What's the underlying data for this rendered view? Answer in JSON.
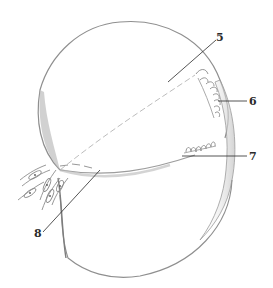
{
  "figure": {
    "type": "anatomical-illustration",
    "labels": [
      {
        "id": "5",
        "text": "5",
        "x": 215,
        "y": 32
      },
      {
        "id": "6",
        "text": "6",
        "x": 249,
        "y": 94
      },
      {
        "id": "7",
        "text": "7",
        "x": 249,
        "y": 151
      },
      {
        "id": "8",
        "text": "8",
        "x": 34,
        "y": 227
      }
    ],
    "colors": {
      "outline": "#8a8a8a",
      "shade": "#c8c8c8",
      "leader": "#2a2a2a",
      "background": "#ffffff"
    }
  }
}
